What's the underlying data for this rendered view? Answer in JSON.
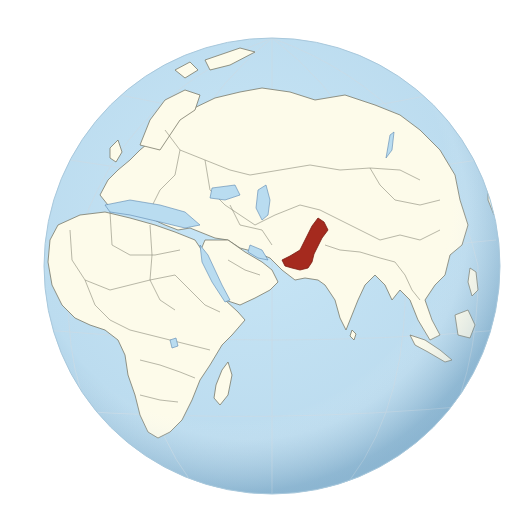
{
  "map": {
    "projection": "orthographic",
    "highlighted_country": "Pakistan",
    "colors": {
      "ocean": "#bfe0f2",
      "land": "#fdfbea",
      "highlight": "#a52a1e",
      "border": "#7a7a6a",
      "coastline": "#5a86b0",
      "graticule": "#c9dbe6"
    },
    "visible_regions": [
      "Europe",
      "Africa",
      "Middle East",
      "South Asia",
      "Central Asia",
      "East Asia",
      "Southeast Asia",
      "Russia",
      "Indian Ocean",
      "Madagascar",
      "Sri Lanka",
      "Australia (edge)"
    ]
  }
}
